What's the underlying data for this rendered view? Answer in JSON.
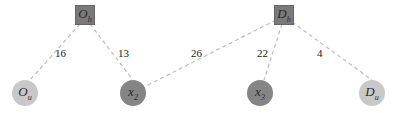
{
  "diagram": {
    "nodes": [
      {
        "id": "Oh",
        "base": "O",
        "sub": "h",
        "shape": "square",
        "color": "#7a7a7a",
        "x": 85,
        "y": 15
      },
      {
        "id": "Dh",
        "base": "D",
        "sub": "h",
        "shape": "square",
        "color": "#7a7a7a",
        "x": 284,
        "y": 15
      },
      {
        "id": "Ou",
        "base": "O",
        "sub": "u",
        "shape": "circle",
        "color": "#c8c8c8",
        "x": 25,
        "y": 93
      },
      {
        "id": "x2",
        "base": "x",
        "sub": "2",
        "shape": "circle",
        "color": "#858585",
        "x": 133,
        "y": 93
      },
      {
        "id": "x3",
        "base": "x",
        "sub": "3",
        "shape": "circle",
        "color": "#858585",
        "x": 260,
        "y": 93
      },
      {
        "id": "Du",
        "base": "D",
        "sub": "u",
        "shape": "circle",
        "color": "#c8c8c8",
        "x": 372,
        "y": 93
      }
    ],
    "edges": [
      {
        "from": "Oh",
        "to": "Ou",
        "label": "16"
      },
      {
        "from": "Oh",
        "to": "x2",
        "label": "13"
      },
      {
        "from": "Dh",
        "to": "x2",
        "label": "26"
      },
      {
        "from": "Dh",
        "to": "x3",
        "label": "22"
      },
      {
        "from": "Dh",
        "to": "Du",
        "label": "4"
      }
    ],
    "edge_color": "#bdbdbd"
  }
}
